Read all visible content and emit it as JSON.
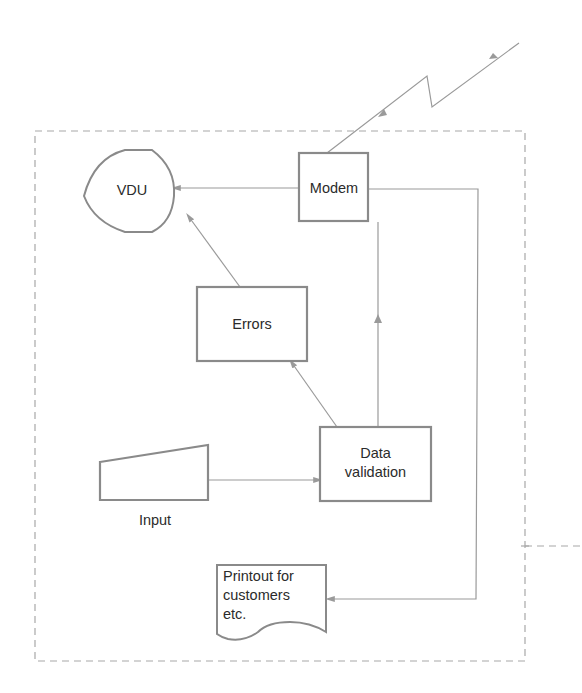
{
  "colors": {
    "background": "#ffffff",
    "node_stroke": "#8a8a8a",
    "connector_stroke": "#9a9a9a",
    "boundary_stroke": "#a8a8a8",
    "text": "#2b2b2b"
  },
  "diagram": {
    "type": "flowchart",
    "boundary": {
      "style": "dashed"
    },
    "nodes": [
      {
        "id": "vdu",
        "shape": "display",
        "label": "VDU"
      },
      {
        "id": "modem",
        "shape": "process",
        "label": "Modem"
      },
      {
        "id": "errors",
        "shape": "process",
        "label": "Errors"
      },
      {
        "id": "data_validation",
        "shape": "process",
        "label": "Data\nvalidation"
      },
      {
        "id": "input",
        "shape": "manual-input",
        "label": "Input"
      },
      {
        "id": "printout",
        "shape": "document",
        "label": "Printout for\ncustomers\netc."
      }
    ],
    "edges": [
      {
        "from": "input",
        "to": "data_validation"
      },
      {
        "from": "data_validation",
        "to": "errors"
      },
      {
        "from": "data_validation",
        "to": "modem"
      },
      {
        "from": "errors",
        "to": "vdu"
      },
      {
        "from": "modem",
        "to": "vdu"
      },
      {
        "from": "modem",
        "to": "printout"
      },
      {
        "from": "modem",
        "to": "external",
        "style": "telecom-link",
        "bidirectional": true
      }
    ]
  }
}
